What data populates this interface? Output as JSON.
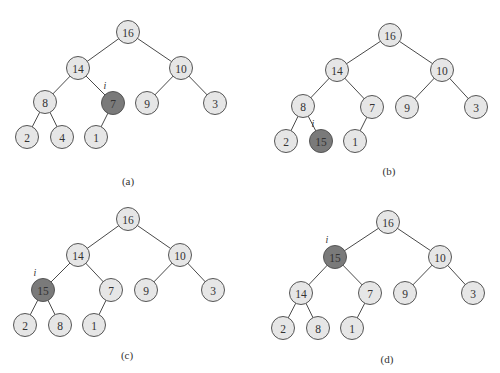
{
  "figure": {
    "colors": {
      "node_fill": "#e6e6e6",
      "highlight_fill": "#7a7a7a",
      "edge": "#4a4a4a",
      "node_stroke": "#555555"
    },
    "node_radius": 11.5,
    "index_marker": "i",
    "panels": [
      {
        "caption": "(a)",
        "caption_pos": [
          128,
          185
        ],
        "highlight": 4,
        "nodes": [
          {
            "value": "16",
            "x": 128,
            "y": 32
          },
          {
            "value": "14",
            "x": 78,
            "y": 68
          },
          {
            "value": "10",
            "x": 181,
            "y": 68
          },
          {
            "value": "8",
            "x": 45,
            "y": 102
          },
          {
            "value": "7",
            "x": 113,
            "y": 103
          },
          {
            "value": "9",
            "x": 147,
            "y": 103
          },
          {
            "value": "3",
            "x": 215,
            "y": 103
          },
          {
            "value": "2",
            "x": 27,
            "y": 137
          },
          {
            "value": "4",
            "x": 62,
            "y": 137
          },
          {
            "value": "1",
            "x": 96,
            "y": 137
          }
        ]
      },
      {
        "caption": "(b)",
        "caption_pos": [
          389,
          175
        ],
        "highlight": 8,
        "nodes": [
          {
            "value": "16",
            "x": 390,
            "y": 35
          },
          {
            "value": "14",
            "x": 337,
            "y": 70
          },
          {
            "value": "10",
            "x": 442,
            "y": 70
          },
          {
            "value": "8",
            "x": 303,
            "y": 106
          },
          {
            "value": "7",
            "x": 372,
            "y": 107
          },
          {
            "value": "9",
            "x": 407,
            "y": 107
          },
          {
            "value": "3",
            "x": 476,
            "y": 107
          },
          {
            "value": "2",
            "x": 286,
            "y": 141
          },
          {
            "value": "15",
            "x": 321,
            "y": 141
          },
          {
            "value": "1",
            "x": 355,
            "y": 141
          }
        ]
      },
      {
        "caption": "(c)",
        "caption_pos": [
          127,
          359
        ],
        "highlight": 3,
        "nodes": [
          {
            "value": "16",
            "x": 128,
            "y": 219
          },
          {
            "value": "14",
            "x": 78,
            "y": 255
          },
          {
            "value": "10",
            "x": 180,
            "y": 255
          },
          {
            "value": "15",
            "x": 43,
            "y": 290
          },
          {
            "value": "7",
            "x": 111,
            "y": 290
          },
          {
            "value": "9",
            "x": 146,
            "y": 290
          },
          {
            "value": "3",
            "x": 213,
            "y": 290
          },
          {
            "value": "2",
            "x": 25,
            "y": 325
          },
          {
            "value": "8",
            "x": 60,
            "y": 325
          },
          {
            "value": "1",
            "x": 94,
            "y": 325
          }
        ]
      },
      {
        "caption": "(d)",
        "caption_pos": [
          387,
          363
        ],
        "highlight": 1,
        "nodes": [
          {
            "value": "16",
            "x": 388,
            "y": 222
          },
          {
            "value": "15",
            "x": 335,
            "y": 257
          },
          {
            "value": "10",
            "x": 440,
            "y": 257
          },
          {
            "value": "14",
            "x": 301,
            "y": 293
          },
          {
            "value": "7",
            "x": 370,
            "y": 293
          },
          {
            "value": "9",
            "x": 405,
            "y": 293
          },
          {
            "value": "3",
            "x": 473,
            "y": 293
          },
          {
            "value": "2",
            "x": 283,
            "y": 328
          },
          {
            "value": "8",
            "x": 318,
            "y": 328
          },
          {
            "value": "1",
            "x": 352,
            "y": 328
          }
        ]
      }
    ],
    "edges": [
      [
        0,
        1
      ],
      [
        0,
        2
      ],
      [
        1,
        3
      ],
      [
        1,
        4
      ],
      [
        2,
        5
      ],
      [
        2,
        6
      ],
      [
        3,
        7
      ],
      [
        3,
        8
      ],
      [
        4,
        9
      ]
    ]
  }
}
